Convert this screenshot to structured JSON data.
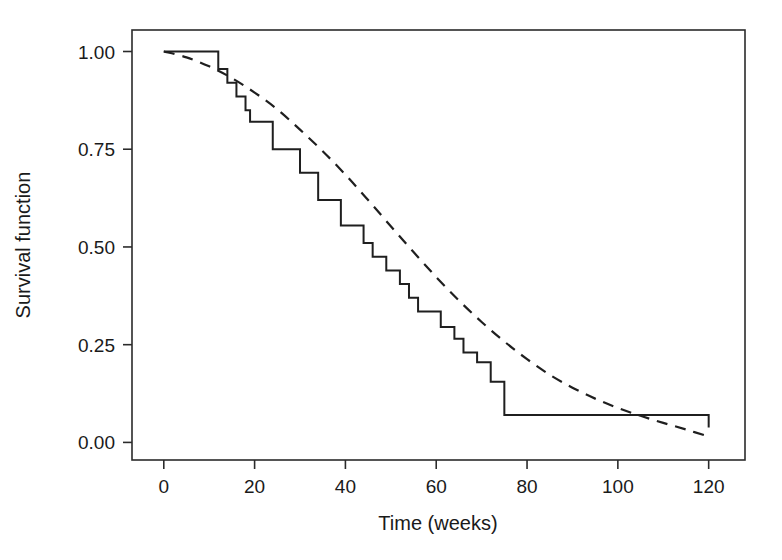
{
  "chart_data": {
    "type": "line",
    "title": "",
    "subtitle": "",
    "xlabel": "Time (weeks)",
    "ylabel": "Survival function",
    "xlim": [
      -7,
      128
    ],
    "ylim": [
      -0.045,
      1.055
    ],
    "xticks": [
      0,
      20,
      40,
      60,
      80,
      100,
      120
    ],
    "xtick_labels": [
      "0",
      "20",
      "40",
      "60",
      "80",
      "100",
      "120"
    ],
    "yticks": [
      0.0,
      0.25,
      0.5,
      0.75,
      1.0
    ],
    "ytick_labels": [
      "0.00",
      "0.25",
      "0.50",
      "0.75",
      "1.00"
    ],
    "grid": false,
    "legend": null,
    "legend_position": "none",
    "frame": "box",
    "annotations": [],
    "series": [
      {
        "name": "Kaplan-Meier estimate",
        "style": "step",
        "linestyle": "solid",
        "color": "#1f1f1f",
        "x": [
          0,
          10,
          12,
          14,
          16,
          18,
          19,
          21,
          24,
          26,
          30,
          34,
          39,
          41,
          44,
          46,
          49,
          52,
          54,
          56,
          58,
          61,
          64,
          66,
          69,
          72,
          75,
          104,
          120
        ],
        "y": [
          1.0,
          1.0,
          0.955,
          0.92,
          0.885,
          0.85,
          0.82,
          0.82,
          0.75,
          0.75,
          0.69,
          0.62,
          0.555,
          0.555,
          0.51,
          0.475,
          0.44,
          0.405,
          0.37,
          0.335,
          0.335,
          0.295,
          0.265,
          0.23,
          0.205,
          0.155,
          0.07,
          0.07,
          0.038
        ]
      },
      {
        "name": "Fitted parametric model",
        "style": "smooth",
        "linestyle": "dashed",
        "color": "#1f1f1f",
        "x": [
          0,
          5,
          10,
          15,
          20,
          25,
          30,
          35,
          40,
          45,
          50,
          55,
          60,
          65,
          70,
          75,
          80,
          85,
          90,
          95,
          100,
          105,
          110,
          115,
          120
        ],
        "y": [
          1.0,
          0.985,
          0.962,
          0.932,
          0.895,
          0.852,
          0.8,
          0.745,
          0.685,
          0.62,
          0.553,
          0.487,
          0.423,
          0.363,
          0.308,
          0.258,
          0.213,
          0.173,
          0.14,
          0.112,
          0.088,
          0.068,
          0.05,
          0.033,
          0.015
        ]
      }
    ]
  },
  "axes": {
    "x_axis_name": "time-axis",
    "y_axis_name": "survival-axis"
  }
}
